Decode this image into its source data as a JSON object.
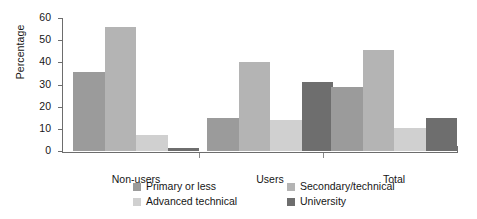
{
  "chart_data": {
    "type": "bar",
    "title": "",
    "xlabel": "",
    "ylabel": "Percentage",
    "ylim": [
      0,
      60
    ],
    "yticks": [
      0,
      10,
      20,
      30,
      40,
      50,
      60
    ],
    "grid": false,
    "legend_position": "bottom",
    "categories": [
      "Non-users",
      "Users",
      "Total"
    ],
    "series": [
      {
        "name": "Primary or less",
        "color": "#9b9b9b",
        "values": [
          35.5,
          15.0,
          29.0
        ]
      },
      {
        "name": "Secondary/technical",
        "color": "#b4b4b4",
        "values": [
          55.8,
          40.0,
          45.5
        ]
      },
      {
        "name": "Advanced technical",
        "color": "#d0d0d0",
        "values": [
          7.2,
          14.0,
          10.5
        ]
      },
      {
        "name": "University",
        "color": "#6e6e6e",
        "values": [
          1.5,
          31.0,
          15.0
        ]
      }
    ]
  },
  "axis": {
    "tick_labels": [
      "60",
      "50",
      "40",
      "30",
      "20",
      "10",
      "0"
    ],
    "y_title": "Percentage"
  },
  "legend": {
    "items": [
      {
        "label": "Primary or less"
      },
      {
        "label": "Advanced technical"
      },
      {
        "label": "Secondary/technical"
      },
      {
        "label": "University"
      }
    ]
  }
}
